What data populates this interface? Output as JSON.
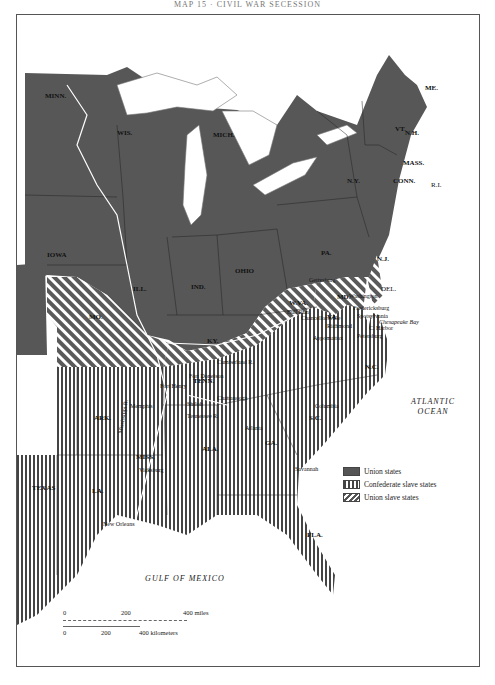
{
  "header": {
    "text": "MAP 15 · CIVIL WAR SECESSION"
  },
  "map": {
    "states": {
      "union": [
        "MINN.",
        "WIS.",
        "MICH.",
        "IOWA",
        "ILL.",
        "IND.",
        "OHIO",
        "PA.",
        "N.Y.",
        "VT.",
        "N.H.",
        "ME.",
        "MASS.",
        "CONN.",
        "R.I.",
        "N.J.",
        "W.VA."
      ],
      "confederate": [
        "VA.",
        "N.C.",
        "S.C.",
        "GA.",
        "FLA.",
        "ALA.",
        "MISS.",
        "LA.",
        "TEXAS",
        "ARK.",
        "TENN."
      ],
      "union_slave": [
        "MO.",
        "KY.",
        "MD.",
        "DEL."
      ]
    },
    "labels": {
      "minn": "MINN.",
      "wis": "WIS.",
      "mich": "MICH.",
      "iowa": "IOWA",
      "ill": "ILL.",
      "ind": "IND.",
      "ohio": "OHIO",
      "pa": "PA.",
      "ny": "N.Y.",
      "vt": "VT.",
      "nh": "N.H.",
      "me": "ME.",
      "mass": "MASS.",
      "conn": "CONN.",
      "ri": "R.I.",
      "nj": "N.J.",
      "del": "DEL.",
      "md": "MD.",
      "wva": "W.VA.",
      "va": "VA.",
      "ky": "KY.",
      "mo": "MO.",
      "tenn": "TENN.",
      "nc": "N.C.",
      "sc": "S.C.",
      "ga": "GA.",
      "fla": "FLA.",
      "ala": "ALA.",
      "miss": "MISS.",
      "ark": "ARK.",
      "la": "LA.",
      "texas": "TEXAS"
    },
    "places": {
      "gettysburg": "Gettysburg",
      "antietam": "Antietam",
      "washington": "Washington",
      "fredericksburg": "Fredericksburg",
      "spotsylvania": "Spotsylvania",
      "chancellorsville": "Chancellorsville",
      "richmond": "Richmond",
      "harbor": "C. Harbor",
      "petersburg": "Petersburg",
      "appomattox": "Appomattox",
      "chesapeake": "Chesapeake Bay",
      "bull_run": "Bull Run",
      "cumberland": "Cumberland R.",
      "fort_donelson": "Fort Donelson",
      "fort_henry": "Fort Henry",
      "shiloh": "Shiloh",
      "chattanooga": "Chattanooga",
      "tennessee_r": "Tennessee R.",
      "memphis": "Memphis",
      "vicksburg": "Vicksburg",
      "mississippi_r": "Mississippi R.",
      "new_orleans": "New Orleans",
      "atlanta": "Atlanta",
      "savannah": "Savannah",
      "columbia": "Columbia"
    },
    "oceans": {
      "atlantic_1": "ATLANTIC",
      "atlantic_2": "OCEAN",
      "gulf": "GULF OF MEXICO"
    },
    "colors": {
      "union": "#555555",
      "confederate_stripe": "#444444",
      "union_slave_stripe": "#555555",
      "water": "#ffffff"
    }
  },
  "legend": {
    "items": [
      {
        "label": "Union states"
      },
      {
        "label": "Confederate slave states"
      },
      {
        "label": "Union slave states"
      }
    ]
  },
  "scale": {
    "miles": {
      "t0": "0",
      "t1": "200",
      "t2": "400 miles"
    },
    "km": {
      "t0": "0",
      "t1": "200",
      "t2": "400 kilometers"
    }
  }
}
